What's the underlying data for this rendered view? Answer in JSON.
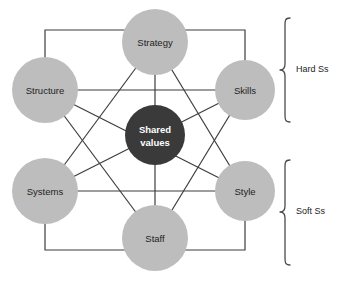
{
  "diagram": {
    "center_node": {
      "id": "shared-values",
      "label_line1": "Shared",
      "label_line2": "values",
      "color": "#3a3a3a",
      "text_color": "#ffffff",
      "cx": 155,
      "cy": 135,
      "r": 30
    },
    "node_color": "#bdbdbd",
    "node_text_color": "#1d1d1d",
    "line_color": "#3d3d3d",
    "background": "#ffffff",
    "nodes": [
      {
        "id": "strategy",
        "label": "Strategy",
        "cx": 155,
        "cy": 42,
        "r": 33,
        "group": "hard"
      },
      {
        "id": "skills",
        "label": "Skills",
        "cx": 245,
        "cy": 90,
        "r": 30,
        "group": "hard"
      },
      {
        "id": "style",
        "label": "Style",
        "cx": 245,
        "cy": 191,
        "r": 30,
        "group": "soft"
      },
      {
        "id": "staff",
        "label": "Staff",
        "cx": 155,
        "cy": 238,
        "r": 33,
        "group": "soft"
      },
      {
        "id": "systems",
        "label": "Systems",
        "cx": 45,
        "cy": 191,
        "r": 33,
        "group": "soft"
      },
      {
        "id": "structure",
        "label": "Structure",
        "cx": 45,
        "cy": 90,
        "r": 33,
        "group": "hard"
      }
    ],
    "connections": [
      {
        "from": "strategy",
        "to": "shared-values"
      },
      {
        "from": "skills",
        "to": "shared-values"
      },
      {
        "from": "style",
        "to": "shared-values"
      },
      {
        "from": "staff",
        "to": "shared-values"
      },
      {
        "from": "systems",
        "to": "shared-values"
      },
      {
        "from": "structure",
        "to": "shared-values"
      },
      {
        "from": "structure",
        "to": "skills"
      },
      {
        "from": "systems",
        "to": "style"
      },
      {
        "from": "strategy",
        "to": "systems"
      },
      {
        "from": "strategy",
        "to": "style"
      },
      {
        "from": "staff",
        "to": "structure"
      },
      {
        "from": "staff",
        "to": "skills"
      },
      {
        "from": "structure",
        "to": "strategy"
      },
      {
        "from": "strategy",
        "to": "skills"
      },
      {
        "from": "skills",
        "to": "style"
      },
      {
        "from": "style",
        "to": "staff"
      },
      {
        "from": "staff",
        "to": "systems"
      },
      {
        "from": "systems",
        "to": "structure"
      }
    ],
    "brackets": [
      {
        "id": "hard-ss",
        "label": "Hard Ss",
        "y_top": 18,
        "y_bottom": 122,
        "label_y": 70
      },
      {
        "id": "soft-ss",
        "label": "Soft Ss",
        "y_top": 160,
        "y_bottom": 265,
        "label_y": 212
      }
    ]
  }
}
